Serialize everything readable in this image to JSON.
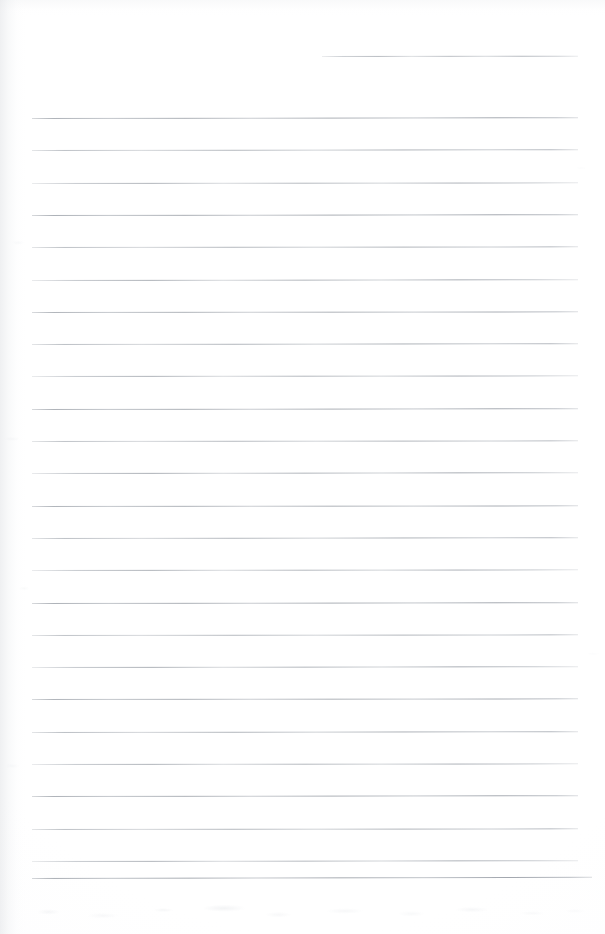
{
  "document": {
    "kind": "scanned-blank-ruled-page",
    "background_color": "#ffffff",
    "paper_tint": "#fefefe",
    "rule_color": "#a1a6ad",
    "rule_thickness_px": 1,
    "page_width_px": 605,
    "page_height_px": 934,
    "visible_text": "",
    "note": ""
  },
  "ruling": {
    "line_spacing_px": 32.3,
    "margin_left_px": 32,
    "margin_right_px": 578,
    "full_rule_count": 25,
    "partial_rule_count": 1,
    "first_full_rule_y_px": 118,
    "last_full_rule_y_px": 877,
    "rules": [
      {
        "id": "rule-00",
        "y": 56,
        "x1": 322,
        "x2": 578,
        "partial": true,
        "slant": -0.6,
        "variant": "var-c",
        "opacity": 0.78
      },
      {
        "id": "rule-01",
        "y": 118,
        "x1": 32,
        "x2": 578,
        "partial": false,
        "slant": -0.8,
        "variant": "",
        "opacity": 0.9
      },
      {
        "id": "rule-02",
        "y": 150.3,
        "x1": 32,
        "x2": 578,
        "partial": false,
        "slant": -0.8,
        "variant": "var-b",
        "opacity": 0.88
      },
      {
        "id": "rule-03",
        "y": 182.6,
        "x1": 32,
        "x2": 578,
        "partial": false,
        "slant": -0.7,
        "variant": "var-c",
        "opacity": 0.86
      },
      {
        "id": "rule-04",
        "y": 214.9,
        "x1": 32,
        "x2": 578,
        "partial": false,
        "slant": -0.8,
        "variant": "",
        "opacity": 0.92
      },
      {
        "id": "rule-05",
        "y": 247.2,
        "x1": 32,
        "x2": 578,
        "partial": false,
        "slant": -0.7,
        "variant": "var-b",
        "opacity": 0.88
      },
      {
        "id": "rule-06",
        "y": 279.5,
        "x1": 32,
        "x2": 578,
        "partial": false,
        "slant": -0.8,
        "variant": "var-c",
        "opacity": 0.9
      },
      {
        "id": "rule-07",
        "y": 311.8,
        "x1": 32,
        "x2": 578,
        "partial": false,
        "slant": -0.7,
        "variant": "",
        "opacity": 0.87
      },
      {
        "id": "rule-08",
        "y": 344.1,
        "x1": 32,
        "x2": 578,
        "partial": false,
        "slant": -0.8,
        "variant": "var-b",
        "opacity": 0.91
      },
      {
        "id": "rule-09",
        "y": 376.4,
        "x1": 32,
        "x2": 578,
        "partial": false,
        "slant": -0.7,
        "variant": "var-c",
        "opacity": 0.88
      },
      {
        "id": "rule-10",
        "y": 408.7,
        "x1": 32,
        "x2": 578,
        "partial": false,
        "slant": -0.8,
        "variant": "",
        "opacity": 0.9
      },
      {
        "id": "rule-11",
        "y": 441.0,
        "x1": 32,
        "x2": 578,
        "partial": false,
        "slant": -0.7,
        "variant": "var-b",
        "opacity": 0.86
      },
      {
        "id": "rule-12",
        "y": 473.3,
        "x1": 32,
        "x2": 578,
        "partial": false,
        "slant": -0.8,
        "variant": "var-c",
        "opacity": 0.92
      },
      {
        "id": "rule-13",
        "y": 505.6,
        "x1": 32,
        "x2": 578,
        "partial": false,
        "slant": -0.7,
        "variant": "",
        "opacity": 0.88
      },
      {
        "id": "rule-14",
        "y": 537.9,
        "x1": 32,
        "x2": 578,
        "partial": false,
        "slant": -0.8,
        "variant": "var-b",
        "opacity": 0.89
      },
      {
        "id": "rule-15",
        "y": 570.2,
        "x1": 32,
        "x2": 578,
        "partial": false,
        "slant": -0.7,
        "variant": "var-c",
        "opacity": 0.87
      },
      {
        "id": "rule-16",
        "y": 602.5,
        "x1": 32,
        "x2": 578,
        "partial": false,
        "slant": -0.8,
        "variant": "",
        "opacity": 0.91
      },
      {
        "id": "rule-17",
        "y": 634.8,
        "x1": 32,
        "x2": 578,
        "partial": false,
        "slant": -0.7,
        "variant": "var-b",
        "opacity": 0.86
      },
      {
        "id": "rule-18",
        "y": 667.1,
        "x1": 32,
        "x2": 578,
        "partial": false,
        "slant": -0.8,
        "variant": "var-c",
        "opacity": 0.9
      },
      {
        "id": "rule-19",
        "y": 699.4,
        "x1": 32,
        "x2": 578,
        "partial": false,
        "slant": -0.7,
        "variant": "",
        "opacity": 0.88
      },
      {
        "id": "rule-20",
        "y": 731.7,
        "x1": 32,
        "x2": 578,
        "partial": false,
        "slant": -0.8,
        "variant": "var-b",
        "opacity": 0.92
      },
      {
        "id": "rule-21",
        "y": 764.0,
        "x1": 32,
        "x2": 578,
        "partial": false,
        "slant": -0.7,
        "variant": "var-c",
        "opacity": 0.87
      },
      {
        "id": "rule-22",
        "y": 796.3,
        "x1": 32,
        "x2": 578,
        "partial": false,
        "slant": -0.8,
        "variant": "",
        "opacity": 0.9
      },
      {
        "id": "rule-23",
        "y": 828.6,
        "x1": 32,
        "x2": 578,
        "partial": false,
        "slant": -0.7,
        "variant": "var-b",
        "opacity": 0.88
      },
      {
        "id": "rule-24",
        "y": 860.9,
        "x1": 32,
        "x2": 578,
        "partial": false,
        "slant": -0.9,
        "variant": "var-c",
        "opacity": 0.86
      },
      {
        "id": "rule-25",
        "y": 877.5,
        "x1": 32,
        "x2": 592,
        "partial": false,
        "slant": -1.3,
        "variant": "",
        "opacity": 0.95
      }
    ]
  }
}
